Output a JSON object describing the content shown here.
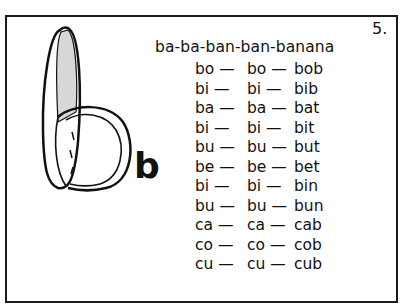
{
  "page": {
    "number": "5.",
    "heading": "ba-ba-ban-ban-banana",
    "letter": "b",
    "illustration": "banana-forming-letter-b",
    "rows": [
      {
        "c1": "bo —",
        "c2": "bo —",
        "c3": "bob"
      },
      {
        "c1": "bi —",
        "c2": "bi —",
        "c3": "bib"
      },
      {
        "c1": "ba —",
        "c2": "ba —",
        "c3": "bat"
      },
      {
        "c1": "bi —",
        "c2": "bi —",
        "c3": "bit"
      },
      {
        "c1": "bu —",
        "c2": "bu —",
        "c3": "but"
      },
      {
        "c1": "be —",
        "c2": "be —",
        "c3": "bet"
      },
      {
        "c1": "bi —",
        "c2": "bi —",
        "c3": "bin"
      },
      {
        "c1": "bu —",
        "c2": "bu —",
        "c3": "bun"
      },
      {
        "c1": "ca —",
        "c2": "ca —",
        "c3": "cab"
      },
      {
        "c1": "co —",
        "c2": "co —",
        "c3": "cob"
      },
      {
        "c1": "cu —",
        "c2": "cu —",
        "c3": "cub"
      }
    ]
  }
}
